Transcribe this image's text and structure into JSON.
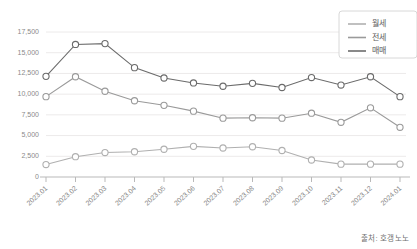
{
  "chart_data": {
    "type": "line",
    "title": "",
    "subtitle": "",
    "xlabel": "",
    "ylabel": "",
    "categories": [
      "2023.01",
      "2023.02",
      "2023.03",
      "2023.04",
      "2023.05",
      "2023.06",
      "2023.07",
      "2023.08",
      "2023.09",
      "2023.10",
      "2023.11",
      "2023.12",
      "2024.01"
    ],
    "ylim": [
      0,
      17500
    ],
    "yticks": [
      0,
      2500,
      5000,
      7500,
      10000,
      12500,
      15000,
      17500
    ],
    "ytick_labels": [
      "0",
      "2,500",
      "5,000",
      "7,500",
      "10,000",
      "12,500",
      "15,000",
      "17,500"
    ],
    "grid": true,
    "legend_position": "top-right",
    "series": [
      {
        "name": "월세",
        "color": "#b0b0b0",
        "values": [
          1500,
          2450,
          2950,
          3050,
          3350,
          3700,
          3500,
          3650,
          3200,
          2050,
          1550,
          1550,
          1550
        ]
      },
      {
        "name": "전세",
        "color": "#9a9a9a",
        "values": [
          9700,
          12100,
          10350,
          9200,
          8650,
          7950,
          7100,
          7150,
          7100,
          7700,
          6600,
          8350,
          6000
        ]
      },
      {
        "name": "매매",
        "color": "#6b6b6b",
        "values": [
          12150,
          16000,
          16100,
          13200,
          11950,
          11350,
          10950,
          11300,
          10800,
          12000,
          11100,
          12100,
          9700
        ]
      }
    ]
  },
  "footer": {
    "source": "출처: 호갱노노"
  }
}
